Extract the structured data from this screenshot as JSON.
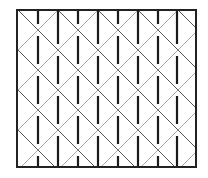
{
  "diagram": {
    "title": "",
    "colors": {
      "background": "#ffffff",
      "frame": "#222222",
      "diagonal_dark": "#555555",
      "diagonal_light": "#aaaaaa",
      "bar": "#1a1a1a"
    },
    "frame": {
      "x": 17,
      "y": 10,
      "width": 179,
      "height": 157,
      "stroke_width": 2
    },
    "lattice": {
      "column_spacing": 20,
      "row_spacing": 40,
      "bar_columns_x": [
        38,
        58,
        78,
        98,
        118,
        138,
        158,
        177
      ],
      "crossings_even_columns_y": [
        30,
        70,
        110,
        150
      ],
      "crossings_odd_columns_y": [
        10,
        50,
        90,
        130
      ],
      "bar_gap": 6
    }
  }
}
